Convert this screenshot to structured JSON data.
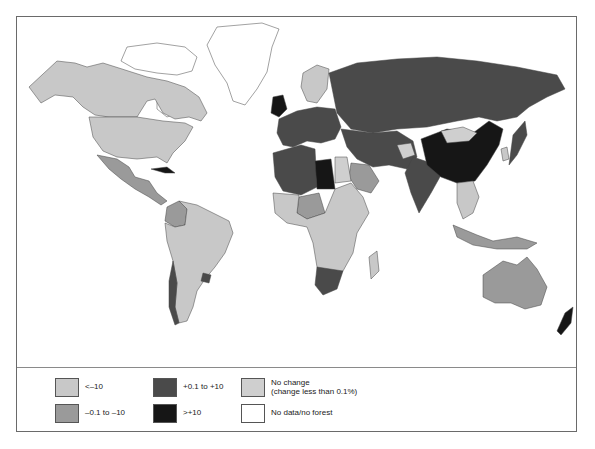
{
  "map": {
    "title": "",
    "classes": {
      "lt_minus10": {
        "color": "#c8c8c8"
      },
      "minus01_to_minus10": {
        "color": "#9a9a9a"
      },
      "plus01_to_plus10": {
        "color": "#4a4a4a"
      },
      "gt_plus10": {
        "color": "#161616"
      },
      "no_change": {
        "color": "#cfcfcf"
      },
      "no_data": {
        "color": "#ffffff"
      }
    },
    "regions": [
      {
        "name": "Greenland & Arctic Canada",
        "class": "no_data"
      },
      {
        "name": "Alaska/Canada",
        "class": "lt_minus10"
      },
      {
        "name": "United States",
        "class": "lt_minus10"
      },
      {
        "name": "Mexico & Central America",
        "class": "minus01_to_minus10"
      },
      {
        "name": "Cuba",
        "class": "gt_plus10"
      },
      {
        "name": "Colombia/Ecuador",
        "class": "minus01_to_minus10"
      },
      {
        "name": "Brazil & South America",
        "class": "lt_minus10"
      },
      {
        "name": "Chile",
        "class": "plus01_to_plus10"
      },
      {
        "name": "Uruguay",
        "class": "plus01_to_plus10"
      },
      {
        "name": "United Kingdom & Ireland",
        "class": "gt_plus10"
      },
      {
        "name": "Western & Central Europe",
        "class": "plus01_to_plus10"
      },
      {
        "name": "Scandinavia",
        "class": "lt_minus10"
      },
      {
        "name": "Russia",
        "class": "plus01_to_plus10"
      },
      {
        "name": "North Africa",
        "class": "plus01_to_plus10"
      },
      {
        "name": "Libya",
        "class": "gt_plus10"
      },
      {
        "name": "Egypt",
        "class": "no_change"
      },
      {
        "name": "Saudi Arabia",
        "class": "minus01_to_minus10"
      },
      {
        "name": "Sub-Saharan Africa",
        "class": "lt_minus10"
      },
      {
        "name": "Nigeria/West Africa",
        "class": "minus01_to_minus10"
      },
      {
        "name": "South Africa",
        "class": "plus01_to_plus10"
      },
      {
        "name": "Madagascar",
        "class": "lt_minus10"
      },
      {
        "name": "Middle East/Central Asia",
        "class": "plus01_to_plus10"
      },
      {
        "name": "Afghanistan",
        "class": "no_change"
      },
      {
        "name": "India",
        "class": "plus01_to_plus10"
      },
      {
        "name": "China",
        "class": "gt_plus10"
      },
      {
        "name": "Mongolia",
        "class": "no_change"
      },
      {
        "name": "Korea",
        "class": "lt_minus10"
      },
      {
        "name": "Japan",
        "class": "plus01_to_plus10"
      },
      {
        "name": "Southeast Asia",
        "class": "lt_minus10"
      },
      {
        "name": "Indonesia",
        "class": "minus01_to_minus10"
      },
      {
        "name": "Australia",
        "class": "minus01_to_minus10"
      },
      {
        "name": "New Zealand",
        "class": "gt_plus10"
      }
    ]
  },
  "legend": {
    "items": [
      {
        "id": "lt_minus10",
        "label": "<–10",
        "color": "#c8c8c8"
      },
      {
        "id": "minus01_to_minus10",
        "label": "–0.1 to –10",
        "color": "#9a9a9a"
      },
      {
        "id": "plus01_to_plus10",
        "label": "+0.1 to +10",
        "color": "#4a4a4a"
      },
      {
        "id": "gt_plus10",
        "label": ">+10",
        "color": "#161616"
      },
      {
        "id": "no_change",
        "label": "No change\n(change less than 0.1%)",
        "color": "#cfcfcf"
      },
      {
        "id": "no_data",
        "label": "No data/no forest",
        "color": "#ffffff"
      }
    ]
  }
}
